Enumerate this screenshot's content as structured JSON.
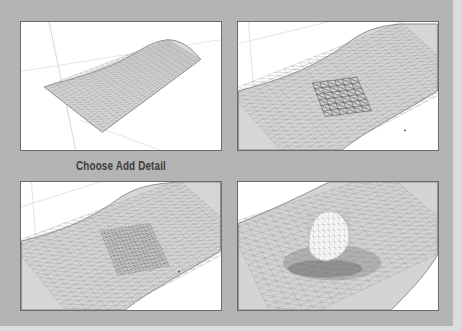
{
  "caption": "Choose Add Detail",
  "panels": [
    {
      "id": "step-1",
      "description": "sandbox-surface-mesh"
    },
    {
      "id": "step-2",
      "description": "selected-region-highlighted"
    },
    {
      "id": "step-3",
      "description": "added-detail-subdivided-region"
    },
    {
      "id": "step-4",
      "description": "smoove-raised-bump"
    }
  ],
  "colors": {
    "background": "#b4b4b4",
    "panel": "#ffffff",
    "mesh_fill": "#d9d9d9",
    "mesh_line": "#8a8a8a",
    "caption": "#3c3c3c"
  }
}
